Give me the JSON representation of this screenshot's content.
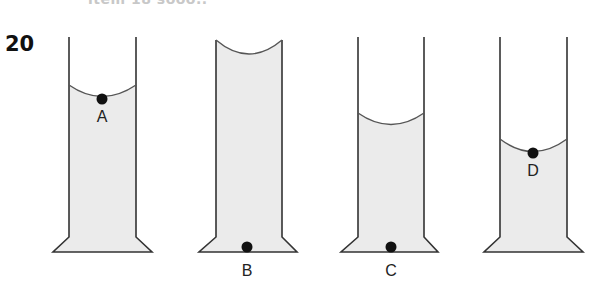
{
  "question": {
    "number": "20",
    "cut_off_header_text": "item 18 sooo.."
  },
  "colors": {
    "liquid": "#ebebeb",
    "outline": "#333333",
    "dot": "#111111"
  },
  "tubes": [
    {
      "id": "tube-1",
      "point_label": "A",
      "meniscus": "concave",
      "liquid_level": "high",
      "point_position": "surface"
    },
    {
      "id": "tube-2",
      "point_label": "B",
      "meniscus": "concave",
      "liquid_level": "full",
      "point_position": "bottom"
    },
    {
      "id": "tube-3",
      "point_label": "C",
      "meniscus": "concave",
      "liquid_level": "middle",
      "point_position": "bottom"
    },
    {
      "id": "tube-4",
      "point_label": "D",
      "meniscus": "concave",
      "liquid_level": "low",
      "point_position": "surface"
    }
  ]
}
